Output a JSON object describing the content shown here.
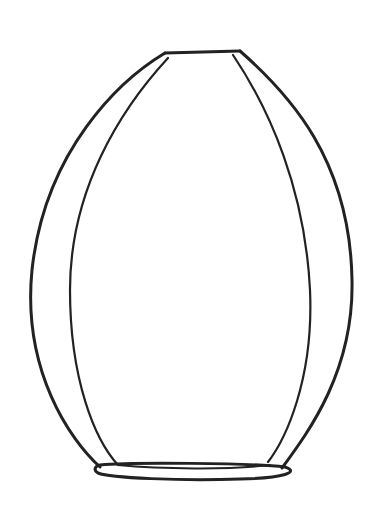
{
  "image": {
    "subject": "vase line drawing",
    "stroke_color": "#222222",
    "background": "#ffffff"
  }
}
